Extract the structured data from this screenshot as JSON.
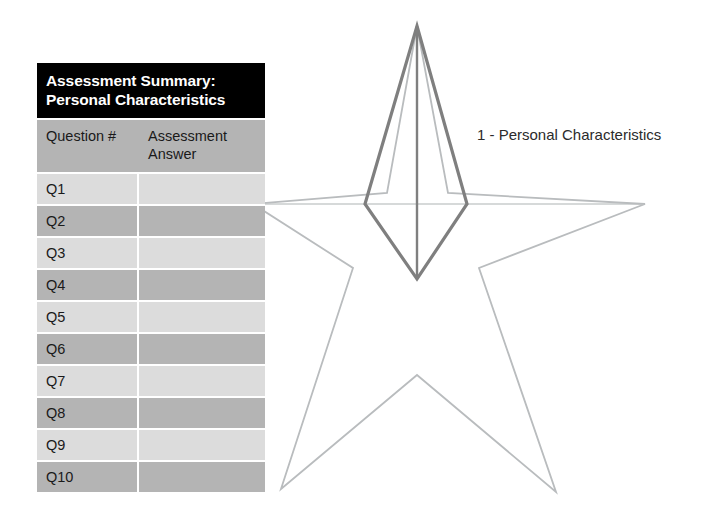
{
  "table": {
    "title_line1": "Assessment Summary:",
    "title_line2": "Personal Characteristics",
    "headers": {
      "question": "Question #",
      "answer_line1": "Assessment",
      "answer_line2": "Answer"
    },
    "rows": [
      {
        "question": "Q1",
        "answer": "",
        "shade": "light"
      },
      {
        "question": "Q2",
        "answer": "",
        "shade": "dark"
      },
      {
        "question": "Q3",
        "answer": "",
        "shade": "light"
      },
      {
        "question": "Q4",
        "answer": "",
        "shade": "dark"
      },
      {
        "question": "Q5",
        "answer": "",
        "shade": "light"
      },
      {
        "question": "Q6",
        "answer": "",
        "shade": "dark"
      },
      {
        "question": "Q7",
        "answer": "",
        "shade": "light"
      },
      {
        "question": "Q8",
        "answer": "",
        "shade": "dark"
      },
      {
        "question": "Q9",
        "answer": "",
        "shade": "light"
      },
      {
        "question": "Q10",
        "answer": "",
        "shade": "dark"
      }
    ]
  },
  "legend": {
    "item_1": "1 - Personal Characteristics"
  },
  "colors": {
    "title_background": "#000000",
    "title_text": "#ffffff",
    "row_light": "#dcdcdc",
    "row_dark": "#b4b4b4",
    "header_background": "#b4b4b4",
    "star_outline": "#b9bcbe",
    "axis_line": "#c9cccd",
    "highlight_outline": "#7f7f7f",
    "page_background": "#ffffff"
  },
  "chart_data": {
    "type": "radar",
    "title": "",
    "categories": [
      "1 - Personal Characteristics"
    ],
    "axes_total": 5,
    "highlighted_axis": {
      "index": 1,
      "label": "1 - Personal Characteristics",
      "direction": "up"
    },
    "series": [
      {
        "name": "Personal Characteristics",
        "values": [
          1.0
        ]
      }
    ],
    "grid": false,
    "legend_position": "right",
    "geometry": {
      "center": [
        417,
        204
      ],
      "star_outline_points": "417,26 467,204 645,204 556,492 417,375 281,489 365,204 253,204",
      "highlight_kite_points": "417,26 467,204 417,279 365,204",
      "highlight_center_line": [
        417,
        26,
        417,
        279
      ],
      "axis_horizontal_line": [
        253,
        204,
        645,
        204
      ]
    }
  }
}
